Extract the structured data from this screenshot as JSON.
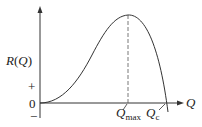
{
  "diagram": {
    "y_axis_label_fn": "R",
    "y_axis_label_open": "(",
    "y_axis_label_var": "Q",
    "y_axis_label_close": ")",
    "x_axis_label": "Q",
    "zero_label": "0",
    "plus_label": "+",
    "minus_label": "−",
    "qmax_label": "Q",
    "qmax_sub": "max",
    "qc_label": "Q",
    "qc_sub": "c"
  },
  "colors": {
    "curve": "#333333",
    "axis": "#333333",
    "dash": "#555555"
  }
}
